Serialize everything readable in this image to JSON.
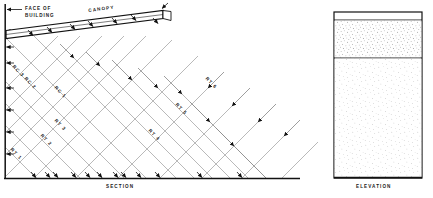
{
  "figure": {
    "section": {
      "caption": "SECTION",
      "face_label_line1": "FACE  OF",
      "face_label_line2": "BUILDING",
      "canopy_label": "CANOPY",
      "ray_labels": [
        {
          "id": "rc3",
          "text": "RC 3"
        },
        {
          "id": "rc2",
          "text": "RC 2"
        },
        {
          "id": "rc1",
          "text": "RC 1"
        },
        {
          "id": "rt1",
          "text": "RT 1"
        },
        {
          "id": "rt2",
          "text": "RT 2"
        },
        {
          "id": "rt3",
          "text": "RT 3"
        },
        {
          "id": "rt4",
          "text": "RT 4"
        },
        {
          "id": "rt5",
          "text": "RT 5"
        },
        {
          "id": "rt6",
          "text": "RT 6"
        }
      ]
    },
    "elevation": {
      "caption": "ELEVATION"
    },
    "colors": {
      "ink": "#111111",
      "ray": "#8a8a8a",
      "stipple_dense": "#7a7a7a",
      "stipple_light": "#9a9a9a",
      "paper": "#ffffff"
    }
  }
}
